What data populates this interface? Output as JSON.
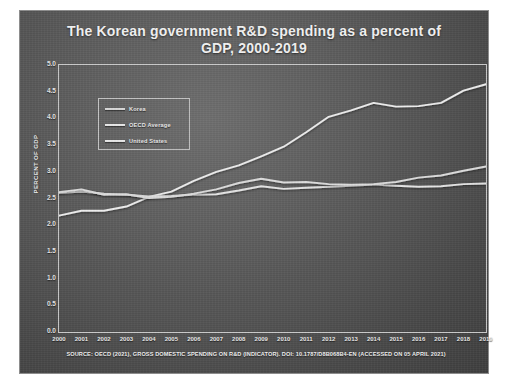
{
  "chart_data": {
    "type": "line",
    "title": "The Korean government R&D spending as a percent of GDP, 2000-2019",
    "title_line1": "The Korean government R&D spending as a percent of",
    "title_line2": "GDP, 2000-2019",
    "xlabel": "",
    "ylabel": "PERCENT OF GDP",
    "ylim": [
      0.0,
      5.0
    ],
    "ytick_step": 0.5,
    "yticks": [
      "0.0",
      "0.5",
      "1.0",
      "1.5",
      "2.0",
      "2.5",
      "3.0",
      "3.5",
      "4.0",
      "4.5",
      "5.0"
    ],
    "grid": false,
    "legend_position": "upper-left-inside",
    "categories": [
      2000,
      2001,
      2002,
      2003,
      2004,
      2005,
      2006,
      2007,
      2008,
      2009,
      2010,
      2011,
      2012,
      2013,
      2014,
      2015,
      2016,
      2017,
      2018,
      2019
    ],
    "xticks": [
      "2000",
      "2001",
      "2002",
      "2003",
      "2004",
      "2005",
      "2006",
      "2007",
      "2008",
      "2009",
      "2010",
      "2011",
      "2012",
      "2013",
      "2014",
      "2015",
      "2016",
      "2017",
      "2018",
      "2019"
    ],
    "series": [
      {
        "name": "Korea",
        "color": "#ededed",
        "values": [
          2.18,
          2.27,
          2.27,
          2.35,
          2.53,
          2.63,
          2.83,
          3.0,
          3.12,
          3.29,
          3.47,
          3.74,
          4.03,
          4.15,
          4.29,
          4.22,
          4.23,
          4.29,
          4.52,
          4.64
        ]
      },
      {
        "name": "OECD Average",
        "color": "#e4e4e4",
        "values": [
          2.6,
          2.63,
          2.59,
          2.57,
          2.54,
          2.55,
          2.57,
          2.58,
          2.65,
          2.73,
          2.68,
          2.7,
          2.72,
          2.74,
          2.76,
          2.74,
          2.72,
          2.73,
          2.77,
          2.78
        ]
      },
      {
        "name": "United States",
        "color": "#dcdcdc",
        "values": [
          2.62,
          2.67,
          2.57,
          2.58,
          2.51,
          2.53,
          2.59,
          2.67,
          2.79,
          2.87,
          2.8,
          2.81,
          2.77,
          2.76,
          2.77,
          2.81,
          2.89,
          2.93,
          3.02,
          3.1
        ]
      }
    ],
    "source_note": "SOURCE: OECD (2021), GROSS DOMESTIC SPENDING ON R&D (INDICATOR). DOI: 10.1787/D8B068B4-EN (ACCESSED ON 05 APRIL 2021)"
  },
  "legend": {
    "items": [
      {
        "label": "Korea"
      },
      {
        "label": "OECD Average"
      },
      {
        "label": "United States"
      }
    ]
  }
}
